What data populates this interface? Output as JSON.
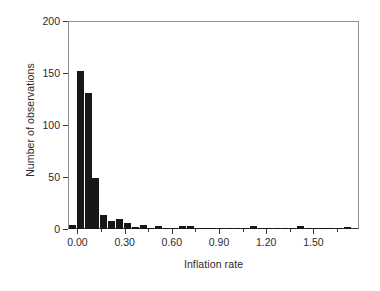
{
  "chart_data": {
    "type": "bar",
    "title": "",
    "subtitle": "",
    "xlabel": "Inflation rate",
    "ylabel": "Number of observations",
    "xlim": [
      -0.06,
      1.79
    ],
    "ylim": [
      0,
      200
    ],
    "grid": false,
    "legend": null,
    "bin_width": 0.05,
    "xticks": [
      0.0,
      0.3,
      0.6,
      0.9,
      1.2,
      1.5
    ],
    "xtick_labels": [
      "0.00",
      "0.30",
      "0.60",
      "0.90",
      "1.20",
      "1.50"
    ],
    "xticks_minor": [
      0.15,
      0.45,
      0.75,
      1.05,
      1.35,
      1.65
    ],
    "yticks": [
      0,
      50,
      100,
      150,
      200
    ],
    "ytick_labels": [
      "0",
      "50",
      "100",
      "150",
      "200"
    ],
    "bar_color": "#171717",
    "bins": [
      {
        "x0": -0.055,
        "x1": -0.005,
        "center": -0.03,
        "value": 4
      },
      {
        "x0": -0.005,
        "x1": 0.045,
        "center": 0.02,
        "value": 152
      },
      {
        "x0": 0.045,
        "x1": 0.095,
        "center": 0.07,
        "value": 131
      },
      {
        "x0": 0.095,
        "x1": 0.145,
        "center": 0.12,
        "value": 49
      },
      {
        "x0": 0.145,
        "x1": 0.195,
        "center": 0.17,
        "value": 13
      },
      {
        "x0": 0.195,
        "x1": 0.245,
        "center": 0.22,
        "value": 8
      },
      {
        "x0": 0.245,
        "x1": 0.295,
        "center": 0.27,
        "value": 10
      },
      {
        "x0": 0.295,
        "x1": 0.345,
        "center": 0.32,
        "value": 6
      },
      {
        "x0": 0.345,
        "x1": 0.395,
        "center": 0.37,
        "value": 2
      },
      {
        "x0": 0.395,
        "x1": 0.445,
        "center": 0.42,
        "value": 4
      },
      {
        "x0": 0.445,
        "x1": 0.495,
        "center": 0.47,
        "value": 1
      },
      {
        "x0": 0.495,
        "x1": 0.545,
        "center": 0.52,
        "value": 3
      },
      {
        "x0": 0.545,
        "x1": 0.595,
        "center": 0.57,
        "value": 1
      },
      {
        "x0": 0.595,
        "x1": 0.645,
        "center": 0.62,
        "value": 1
      },
      {
        "x0": 0.645,
        "x1": 0.695,
        "center": 0.67,
        "value": 3
      },
      {
        "x0": 0.695,
        "x1": 0.745,
        "center": 0.72,
        "value": 3
      },
      {
        "x0": 0.745,
        "x1": 0.795,
        "center": 0.77,
        "value": 1
      },
      {
        "x0": 0.795,
        "x1": 0.845,
        "center": 0.82,
        "value": 1
      },
      {
        "x0": 0.845,
        "x1": 0.895,
        "center": 0.87,
        "value": 1
      },
      {
        "x0": 0.895,
        "x1": 0.945,
        "center": 0.92,
        "value": 1
      },
      {
        "x0": 0.945,
        "x1": 0.995,
        "center": 0.97,
        "value": 1
      },
      {
        "x0": 0.995,
        "x1": 1.045,
        "center": 1.02,
        "value": 1
      },
      {
        "x0": 1.045,
        "x1": 1.095,
        "center": 1.07,
        "value": 1
      },
      {
        "x0": 1.095,
        "x1": 1.145,
        "center": 1.12,
        "value": 3
      },
      {
        "x0": 1.145,
        "x1": 1.195,
        "center": 1.17,
        "value": 1
      },
      {
        "x0": 1.195,
        "x1": 1.245,
        "center": 1.22,
        "value": 1
      },
      {
        "x0": 1.245,
        "x1": 1.295,
        "center": 1.27,
        "value": 1
      },
      {
        "x0": 1.295,
        "x1": 1.345,
        "center": 1.32,
        "value": 1
      },
      {
        "x0": 1.345,
        "x1": 1.395,
        "center": 1.37,
        "value": 1
      },
      {
        "x0": 1.395,
        "x1": 1.445,
        "center": 1.42,
        "value": 3
      },
      {
        "x0": 1.445,
        "x1": 1.495,
        "center": 1.47,
        "value": 1
      },
      {
        "x0": 1.495,
        "x1": 1.545,
        "center": 1.52,
        "value": 1
      },
      {
        "x0": 1.545,
        "x1": 1.595,
        "center": 1.57,
        "value": 1
      },
      {
        "x0": 1.595,
        "x1": 1.645,
        "center": 1.62,
        "value": 1
      },
      {
        "x0": 1.645,
        "x1": 1.695,
        "center": 1.67,
        "value": 1
      },
      {
        "x0": 1.695,
        "x1": 1.745,
        "center": 1.72,
        "value": 2
      }
    ]
  }
}
